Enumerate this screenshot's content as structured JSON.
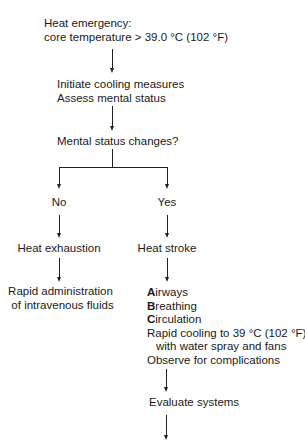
{
  "flowchart": {
    "start": {
      "line1": "Heat emergency:",
      "line2": "core temperature > 39.0 °C (102 °F)"
    },
    "step1": {
      "line1": "Initiate cooling measures",
      "line2": "Assess mental status"
    },
    "decision": "Mental status changes?",
    "branches": {
      "no": {
        "label": "No",
        "diagnosis": "Heat exhaustion",
        "treatment": {
          "line1": "Rapid administration",
          "line2": "of intravenous fluids"
        }
      },
      "yes": {
        "label": "Yes",
        "diagnosis": "Heat stroke",
        "treatment": {
          "airways_initial": "A",
          "airways_rest": "irways",
          "breathing_initial": "B",
          "breathing_rest": "reathing",
          "circulation_initial": "C",
          "circulation_rest": "irculation",
          "cooling_line1": "Rapid cooling to 39 °C (102 °F)",
          "cooling_line2": "with water spray and fans",
          "observe": "Observe for complications"
        },
        "next": "Evaluate systems"
      }
    }
  }
}
